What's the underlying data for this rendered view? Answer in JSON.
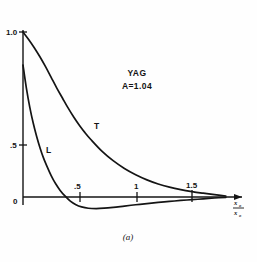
{
  "figure": {
    "caption": "(a)",
    "material_label": "YAG",
    "parameter_label": "A=1.04",
    "x_axis_label_numerator": "x",
    "x_axis_label_numerator_sub": "o",
    "x_axis_label_denominator": "x",
    "x_axis_label_denominator_sub": "o",
    "curve_label_t": "T",
    "curve_label_l": "L"
  },
  "chart_data": {
    "type": "line",
    "title": "YAG",
    "subtitle": "A=1.04",
    "annotations": [
      "YAG",
      "A=1.04",
      "(a)"
    ],
    "xlabel": "x/x_o",
    "ylabel": "",
    "xlim": [
      0,
      1.82
    ],
    "ylim": [
      -0.16,
      1.06
    ],
    "grid": false,
    "legend": "inline-curve-labels",
    "xticks": [
      0.5,
      1,
      1.5
    ],
    "xticklabels": [
      ".5",
      "1",
      "1.5"
    ],
    "yticks": [
      0,
      0.5,
      1.0
    ],
    "yticklabels": [
      "0",
      ".5",
      "1.0"
    ],
    "series": [
      {
        "name": "T",
        "label": "T",
        "x": [
          0,
          0.05,
          0.1,
          0.15,
          0.2,
          0.25,
          0.3,
          0.35,
          0.4,
          0.45,
          0.5,
          0.55,
          0.6,
          0.7,
          0.8,
          0.9,
          1.0,
          1.1,
          1.2,
          1.3,
          1.4,
          1.5,
          1.6,
          1.7,
          1.8
        ],
        "values": [
          1.0,
          0.955,
          0.905,
          0.85,
          0.79,
          0.725,
          0.66,
          0.6,
          0.54,
          0.485,
          0.435,
          0.39,
          0.35,
          0.278,
          0.22,
          0.173,
          0.135,
          0.104,
          0.079,
          0.06,
          0.045,
          0.033,
          0.023,
          0.014,
          0.006
        ]
      },
      {
        "name": "L",
        "label": "L",
        "x": [
          0,
          0.03,
          0.06,
          0.09,
          0.12,
          0.15,
          0.18,
          0.21,
          0.25,
          0.29,
          0.33,
          0.37,
          0.42,
          0.47,
          0.52,
          0.58,
          0.65,
          0.72,
          0.8,
          0.9,
          1.0,
          1.1,
          1.2,
          1.3,
          1.4,
          1.5,
          1.6,
          1.7,
          1.8
        ],
        "values": [
          0.8,
          0.66,
          0.545,
          0.45,
          0.37,
          0.3,
          0.24,
          0.19,
          0.13,
          0.08,
          0.04,
          0.008,
          -0.025,
          -0.047,
          -0.06,
          -0.068,
          -0.07,
          -0.068,
          -0.063,
          -0.055,
          -0.047,
          -0.04,
          -0.033,
          -0.027,
          -0.021,
          -0.016,
          -0.011,
          -0.006,
          -0.002
        ]
      }
    ]
  }
}
